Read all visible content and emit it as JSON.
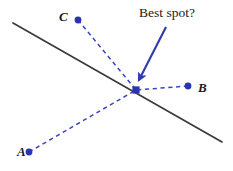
{
  "figure": {
    "width": 233,
    "height": 171,
    "background_color": "#ffffff"
  },
  "colors": {
    "point_blue": "#2a33b0",
    "dash_blue": "#3b45c4",
    "arrow_blue": "#2f3aad",
    "line_black": "#3a3a3a",
    "text_black": "#1a1a1a"
  },
  "annotation": {
    "callout_text": "Best spot?"
  },
  "points": [
    {
      "id": "A",
      "label": "A",
      "x": 29,
      "y": 152,
      "label_x": 17,
      "label_y": 145
    },
    {
      "id": "B",
      "label": "B",
      "x": 188,
      "y": 86,
      "label_x": 198,
      "label_y": 81
    },
    {
      "id": "C",
      "label": "C",
      "x": 78,
      "y": 20,
      "label_x": 59,
      "label_y": 10
    },
    {
      "id": "best",
      "label": "",
      "x": 136,
      "y": 90,
      "label_x": 0,
      "label_y": 0
    }
  ],
  "solid_line": {
    "x1": 13,
    "y1": 23,
    "x2": 222,
    "y2": 142
  },
  "dashed_connectors": [
    {
      "from": "A",
      "x1": 29,
      "y1": 152,
      "x2": 136,
      "y2": 90
    },
    {
      "from": "B",
      "x1": 188,
      "y1": 86,
      "x2": 136,
      "y2": 90
    },
    {
      "from": "C",
      "x1": 78,
      "y1": 20,
      "x2": 136,
      "y2": 90
    }
  ],
  "arrow": {
    "x1": 166,
    "y1": 27,
    "x2": 138.5,
    "y2": 81
  }
}
